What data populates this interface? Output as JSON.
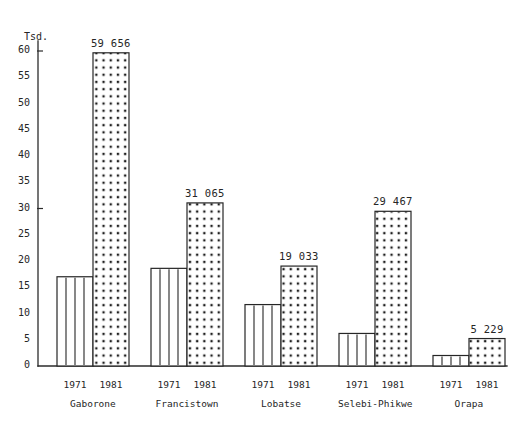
{
  "chart_data": {
    "type": "bar",
    "title": "",
    "subtitle": "",
    "xlabel": "",
    "ylabel": "Tsd.",
    "ylim": [
      0,
      62
    ],
    "grid": false,
    "legend_position": "none",
    "y_ticks": [
      0,
      5,
      10,
      15,
      20,
      25,
      30,
      35,
      40,
      45,
      50,
      55,
      60
    ],
    "y_tick_labels": [
      "0",
      "5",
      "10",
      "15",
      "20",
      "25",
      "30",
      "35",
      "40",
      "45",
      "50",
      "55",
      "60"
    ],
    "unit_note": "Tsd.",
    "categories": [
      "Gaborone",
      "Francistown",
      "Lobatse",
      "Selebi-Phikwe",
      "Orapa",
      "Jwaneng"
    ],
    "series": [
      {
        "name": "1971",
        "pattern": "vertical-lines",
        "values": [
          17.0,
          18.6,
          11.7,
          6.2,
          2.0,
          null
        ],
        "labels": [
          "",
          "",
          "",
          "",
          "",
          ""
        ]
      },
      {
        "name": "1981",
        "pattern": "dots",
        "values": [
          59.656,
          31.065,
          19.033,
          29.467,
          5.229,
          5.568
        ],
        "labels": [
          "59 656",
          "31 065",
          "19 033",
          "29 467",
          "5 229",
          "5 568"
        ]
      }
    ],
    "bars": [
      {
        "group": "Gaborone",
        "year": "1971",
        "value": 17.0,
        "label": "",
        "pattern": "vertical-lines"
      },
      {
        "group": "Gaborone",
        "year": "1981",
        "value": 59.656,
        "label": "59 656",
        "pattern": "dots"
      },
      {
        "group": "Francistown",
        "year": "1971",
        "value": 18.6,
        "label": "",
        "pattern": "vertical-lines"
      },
      {
        "group": "Francistown",
        "year": "1981",
        "value": 31.065,
        "label": "31 065",
        "pattern": "dots"
      },
      {
        "group": "Lobatse",
        "year": "1971",
        "value": 11.7,
        "label": "",
        "pattern": "vertical-lines"
      },
      {
        "group": "Lobatse",
        "year": "1981",
        "value": 19.033,
        "label": "19 033",
        "pattern": "dots"
      },
      {
        "group": "Selebi-Phikwe",
        "year": "1971",
        "value": 6.2,
        "label": "",
        "pattern": "vertical-lines"
      },
      {
        "group": "Selebi-Phikwe",
        "year": "1981",
        "value": 29.467,
        "label": "29 467",
        "pattern": "dots"
      },
      {
        "group": "Orapa",
        "year": "1971",
        "value": 2.0,
        "label": "",
        "pattern": "vertical-lines"
      },
      {
        "group": "Orapa",
        "year": "1981",
        "value": 5.229,
        "label": "5 229",
        "pattern": "dots"
      },
      {
        "group": "Jwaneng",
        "year": "1981",
        "value": 5.568,
        "label": "5 568",
        "pattern": "dots"
      }
    ],
    "colors": {
      "axis": "#2b2b2b",
      "bar_outline": "#262626",
      "bar_fill": "#ffffff",
      "text": "#262626",
      "background": "#ffffff"
    }
  },
  "axis": {
    "unit_label": "Tsd.",
    "ticks": [
      "60",
      "55",
      "50",
      "45",
      "40",
      "35",
      "30",
      "25",
      "20",
      "15",
      "10",
      "5",
      "0"
    ]
  },
  "groups": [
    {
      "name": "Gaborone",
      "years": [
        "1971",
        "1981"
      ]
    },
    {
      "name": "Francistown",
      "years": [
        "1971",
        "1981"
      ]
    },
    {
      "name": "Lobatse",
      "years": [
        "1971",
        "1981"
      ]
    },
    {
      "name": "Selebi-Phikwe",
      "years": [
        "1971",
        "1981"
      ]
    },
    {
      "name": "Orapa",
      "years": [
        "1971",
        "1981"
      ]
    },
    {
      "name": "Jwaneng",
      "years": [
        "1981"
      ]
    }
  ]
}
